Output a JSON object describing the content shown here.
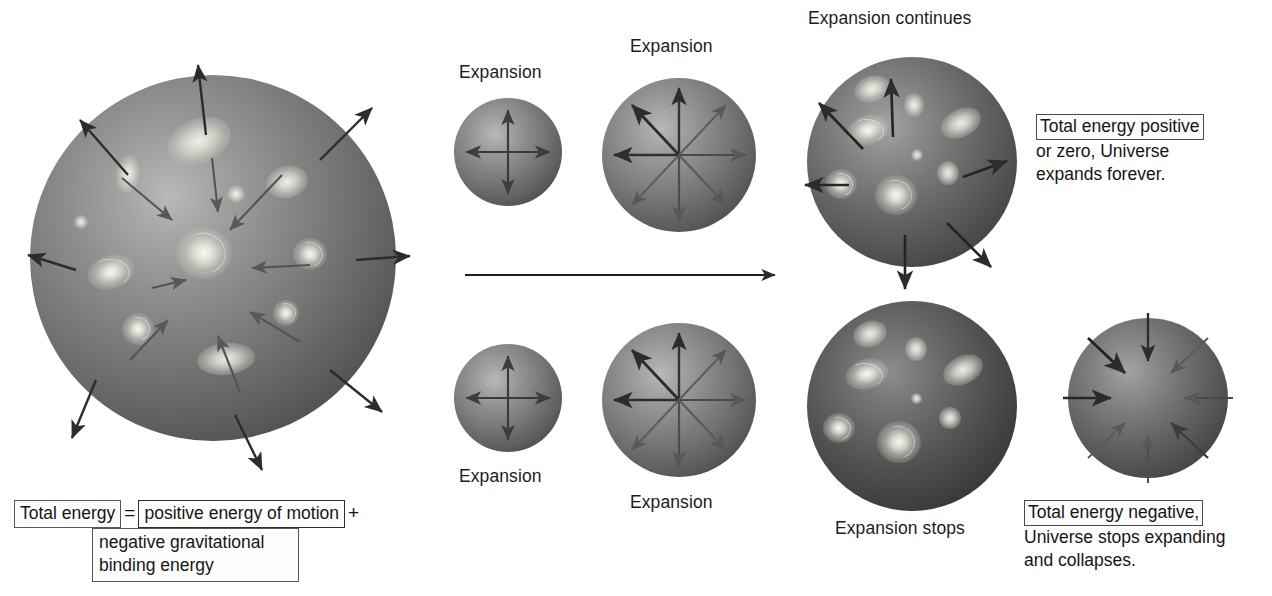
{
  "figure": {
    "title_internal": "Fate of the Universe: open versus closed expansion",
    "background_color": "#ffffff",
    "ink_color": "#1c1c1c"
  },
  "labels": {
    "top_small": "Expansion",
    "top_medium": "Expansion",
    "top_large": "Expansion continues",
    "bottom_small": "Expansion",
    "bottom_medium": "Expansion",
    "bottom_large": "Expansion stops"
  },
  "callouts": {
    "open": {
      "line1": "Total energy positive",
      "line2": "or zero, Universe",
      "line3": "expands forever."
    },
    "closed": {
      "line1": "Total energy negative,",
      "line2": "Universe stops expanding",
      "line3": "and collapses."
    }
  },
  "equation": {
    "term_total": "Total energy",
    "operator_equals": "=",
    "term_kinetic": "positive energy of motion",
    "operator_plus": "+",
    "term_potential_line1": "negative gravitational",
    "term_potential_line2": "binding energy"
  },
  "time_arrow": {
    "name": "time-direction-arrow",
    "x1": 465,
    "y1": 274,
    "x2": 778,
    "y2": 274
  },
  "spheres": [
    {
      "id": "main-universe-sphere",
      "cx": 213,
      "cy": 258,
      "r": 183,
      "tone": "normal",
      "arrows_outward": 8,
      "arrows_inward": 8,
      "galaxy_count": 11
    },
    {
      "id": "open-stage-1-sphere",
      "cx": 508,
      "cy": 152,
      "r": 54,
      "tone": "normal",
      "arrows_outward": 4,
      "arrows_inward": 0,
      "galaxy_count": 0
    },
    {
      "id": "open-stage-2-sphere",
      "cx": 679,
      "cy": 155,
      "r": 77,
      "tone": "normal",
      "arrows_outward": 8,
      "arrows_inward": 0,
      "galaxy_count": 0
    },
    {
      "id": "open-stage-3-sphere",
      "cx": 912,
      "cy": 162,
      "r": 105,
      "tone": "dim",
      "arrows_outward": 6,
      "arrows_inward": 0,
      "galaxy_count": 8
    },
    {
      "id": "closed-stage-1-sphere",
      "cx": 508,
      "cy": 398,
      "r": 54,
      "tone": "normal",
      "arrows_outward": 4,
      "arrows_inward": 0,
      "galaxy_count": 0
    },
    {
      "id": "closed-stage-2-sphere",
      "cx": 679,
      "cy": 400,
      "r": 77,
      "tone": "normal",
      "arrows_outward": 8,
      "arrows_inward": 0,
      "galaxy_count": 0
    },
    {
      "id": "closed-stage-3-sphere",
      "cx": 912,
      "cy": 406,
      "r": 105,
      "tone": "dark",
      "arrows_outward": 0,
      "arrows_inward": 0,
      "galaxy_count": 8
    },
    {
      "id": "closed-stage-4-sphere",
      "cx": 1148,
      "cy": 398,
      "r": 80,
      "tone": "dim",
      "arrows_outward": 0,
      "arrows_inward": 8,
      "galaxy_count": 0
    }
  ]
}
